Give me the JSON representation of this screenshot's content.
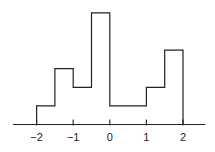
{
  "chart_data": {
    "type": "bar",
    "subtype": "histogram-step-outline",
    "title": "",
    "xlabel": "",
    "ylabel": "",
    "bin_edges": [
      -2,
      -1.5,
      -1,
      -0.5,
      0,
      0.5,
      1,
      1.5,
      2
    ],
    "values": [
      1,
      3,
      2,
      6,
      1,
      1,
      2,
      4
    ],
    "xlim": [
      -2.65,
      2.6
    ],
    "ylim": [
      0,
      6.5
    ],
    "x_ticks": [
      -2,
      -1,
      0,
      1,
      2
    ],
    "x_tick_labels": [
      "−2",
      "−1",
      "0",
      "1",
      "2"
    ],
    "y_axis_shown": false,
    "grid": false,
    "legend": null,
    "line_color": "#222222"
  },
  "layout": {
    "axis_y_px": 124.5,
    "axis_x_start_px": 13,
    "axis_x_end_px": 205,
    "x0_px": 109.8,
    "px_per_unit": 36.6,
    "px_per_count": 18.6,
    "tick_len_px": 5,
    "label_y_px": 141
  }
}
